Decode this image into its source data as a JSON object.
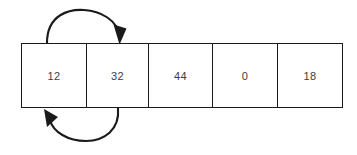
{
  "diagram": {
    "stroke_color": "#1a1a1a",
    "text_color": "#3d3d3d",
    "background_color": "#ffffff",
    "array": {
      "name": "array-cells",
      "cells": [
        {
          "index": 0,
          "value": "12"
        },
        {
          "index": 1,
          "value": "32"
        },
        {
          "index": 2,
          "value": "44"
        },
        {
          "index": 3,
          "value": "0"
        },
        {
          "index": 4,
          "value": "18"
        }
      ]
    },
    "arrows": [
      {
        "name": "top-swap-arrow",
        "label": "",
        "description": "curved arrow above array from cell 0 to cell 1",
        "direction": "left-to-right",
        "position": "above",
        "from_cell_index": 0,
        "to_cell_index": 1
      },
      {
        "name": "bottom-swap-arrow",
        "label": "",
        "description": "curved arrow below array from cell 1 back to cell 0",
        "direction": "right-to-left",
        "position": "below",
        "from_cell_index": 1,
        "to_cell_index": 0
      }
    ]
  }
}
